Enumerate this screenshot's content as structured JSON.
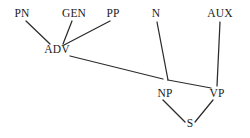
{
  "diagram": {
    "type": "syntax-tree",
    "title": "",
    "background_color": "#ffffff",
    "edge_color": "#2b2b2b",
    "label_color": "#1a1a1a",
    "nodes": [
      {
        "id": "PN",
        "label": "PN",
        "x": 22,
        "y": 17
      },
      {
        "id": "GEN",
        "label": "GEN",
        "x": 74,
        "y": 17
      },
      {
        "id": "PP",
        "label": "PP",
        "x": 113,
        "y": 17
      },
      {
        "id": "N",
        "label": "N",
        "x": 156,
        "y": 17
      },
      {
        "id": "AUX",
        "label": "AUX",
        "x": 220,
        "y": 17
      },
      {
        "id": "ADV",
        "label": "ADV",
        "x": 57,
        "y": 53
      },
      {
        "id": "NP",
        "label": "NP",
        "x": 165,
        "y": 97
      },
      {
        "id": "VP",
        "label": "VP",
        "x": 217,
        "y": 97
      },
      {
        "id": "S",
        "label": "S",
        "x": 190,
        "y": 127
      }
    ],
    "edges": [
      {
        "from": "PN",
        "to": "ADV",
        "x1": 26,
        "y1": 21,
        "x2": 50,
        "y2": 44
      },
      {
        "from": "GEN",
        "to": "ADV",
        "x1": 72,
        "y1": 21,
        "x2": 63,
        "y2": 44
      },
      {
        "from": "PP",
        "to": "ADV",
        "x1": 110,
        "y1": 21,
        "x2": 64,
        "y2": 45
      },
      {
        "from": "ADV",
        "to": "NP",
        "x1": 70,
        "y1": 56,
        "x2": 163,
        "y2": 79
      },
      {
        "from": "N",
        "to": "NP",
        "x1": 157,
        "y1": 22,
        "x2": 168,
        "y2": 80
      },
      {
        "from": "NP",
        "to": "VP",
        "x1": 168,
        "y1": 80,
        "x2": 211,
        "y2": 88
      },
      {
        "from": "AUX",
        "to": "VP",
        "x1": 220,
        "y1": 22,
        "x2": 217,
        "y2": 86
      },
      {
        "from": "NP",
        "to": "S",
        "x1": 163,
        "y1": 100,
        "x2": 185,
        "y2": 122
      },
      {
        "from": "VP",
        "to": "S",
        "x1": 213,
        "y1": 100,
        "x2": 195,
        "y2": 122
      }
    ]
  }
}
